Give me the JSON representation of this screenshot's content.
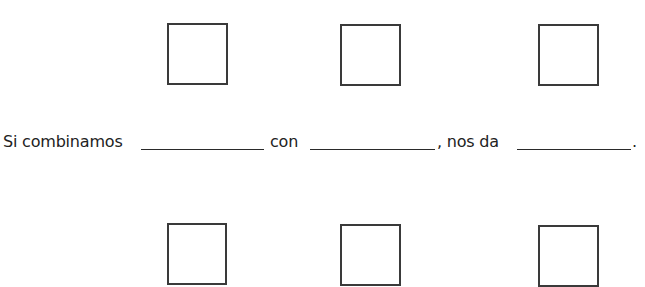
{
  "worksheet": {
    "sentence": {
      "part1": "Si combinamos",
      "part2": "con",
      "part3": ", nos da",
      "end": ".",
      "blanks": [
        {
          "id": "blank-1",
          "value": ""
        },
        {
          "id": "blank-2",
          "value": ""
        },
        {
          "id": "blank-3",
          "value": ""
        }
      ]
    },
    "top_boxes": [
      {
        "id": "top-box-1",
        "content": ""
      },
      {
        "id": "top-box-2",
        "content": ""
      },
      {
        "id": "top-box-3",
        "content": ""
      }
    ],
    "bottom_boxes": [
      {
        "id": "bottom-box-1",
        "content": ""
      },
      {
        "id": "bottom-box-2",
        "content": ""
      },
      {
        "id": "bottom-box-3",
        "content": ""
      }
    ],
    "colors": {
      "box_border": "#3a3a3a",
      "text": "#222222",
      "background": "#ffffff"
    }
  }
}
